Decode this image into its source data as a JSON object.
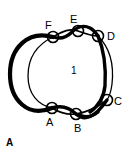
{
  "figure": {
    "label": "A",
    "label_x": 6,
    "label_y": 138,
    "width": 130,
    "height": 153,
    "background": "#ffffff",
    "stroke_color": "#000000"
  },
  "region_labels": [
    {
      "text": "1",
      "x": 71,
      "y": 66
    }
  ],
  "crossings": [
    {
      "id": "A",
      "label": "A",
      "cx": 52,
      "cy": 108,
      "r": 5.5,
      "label_x": 46,
      "label_y": 117
    },
    {
      "id": "B",
      "label": "B",
      "cx": 76,
      "cy": 114,
      "r": 5.5,
      "label_x": 74,
      "label_y": 123
    },
    {
      "id": "C",
      "label": "C",
      "cx": 107,
      "cy": 100,
      "r": 5.5,
      "label_x": 114,
      "label_y": 96
    },
    {
      "id": "D",
      "label": "D",
      "cx": 98,
      "cy": 36,
      "r": 5.5,
      "label_x": 107,
      "label_y": 31
    },
    {
      "id": "E",
      "label": "E",
      "cx": 78,
      "cy": 31,
      "r": 5.5,
      "label_x": 70,
      "label_y": 14
    },
    {
      "id": "F",
      "label": "F",
      "cx": 53,
      "cy": 37,
      "r": 5.5,
      "label_x": 45,
      "label_y": 20
    }
  ],
  "strands": {
    "outer_loop_thick": "M 53,37 C 28,30 10,48 10,74 C 10,100 28,118 52,108",
    "inner_loop_thin": "M 53,37 C 34,46 28,60 28,76 C 28,94 38,105 52,108",
    "right_thin_arc": "M 98,36 C 110,48 114,66 112,84 C 111,92 109,97 107,100",
    "right_thick_arc": "M 98,36 C 104,50 106,70 105,86 C 104,95 100,105 90,112",
    "top_strand_a": "M 53,37 C 62,40 68,36 72,32 C 76,28 82,24 90,28 C 94,30 96,33 98,36",
    "top_strand_b": "M 53,37 C 63,31 70,28 78,31 C 86,34 92,36 98,36",
    "bottom_strand_a": "M 52,108 C 60,113 68,115 76,114 C 88,112 98,107 107,100",
    "bottom_strand_b": "M 52,108 C 62,105 70,108 76,114 C 84,121 94,119 107,100",
    "bottom_tail": "M 76,114 C 84,118 92,117 98,112"
  },
  "colors": {
    "stroke": "#000000",
    "fill": "#ffffff",
    "text": "#000000"
  }
}
